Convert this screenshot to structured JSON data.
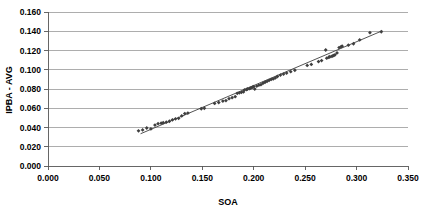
{
  "chart_data": {
    "type": "scatter",
    "title": "",
    "xlabel": "SOA",
    "ylabel": "IPBA - AVG",
    "xlim": [
      0.0,
      0.35
    ],
    "ylim": [
      0.0,
      0.16
    ],
    "grid": true,
    "grid_axis": "y",
    "legend": false,
    "legend_position": "none",
    "marker_style": "diamond",
    "marker_color": "#3f3f3f",
    "xticks": [
      0.0,
      0.05,
      0.1,
      0.15,
      0.2,
      0.25,
      0.3,
      0.35
    ],
    "xtick_labels": [
      "0.000",
      "0.050",
      "0.100",
      "0.150",
      "0.200",
      "0.250",
      "0.300",
      "0.350"
    ],
    "yticks": [
      0.0,
      0.02,
      0.04,
      0.06,
      0.08,
      0.1,
      0.12,
      0.14,
      0.16
    ],
    "ytick_labels": [
      "0.000",
      "0.020",
      "0.040",
      "0.060",
      "0.080",
      "0.100",
      "0.120",
      "0.140",
      "0.160"
    ],
    "series": [
      {
        "name": "IPBA - AVG",
        "type": "scatter",
        "points": [
          [
            0.088,
            0.0365
          ],
          [
            0.092,
            0.0375
          ],
          [
            0.096,
            0.0395
          ],
          [
            0.1,
            0.0385
          ],
          [
            0.104,
            0.0425
          ],
          [
            0.107,
            0.044
          ],
          [
            0.11,
            0.0445
          ],
          [
            0.112,
            0.045
          ],
          [
            0.115,
            0.0455
          ],
          [
            0.118,
            0.0465
          ],
          [
            0.121,
            0.048
          ],
          [
            0.124,
            0.049
          ],
          [
            0.127,
            0.0495
          ],
          [
            0.13,
            0.052
          ],
          [
            0.133,
            0.0545
          ],
          [
            0.136,
            0.055
          ],
          [
            0.149,
            0.0595
          ],
          [
            0.152,
            0.06
          ],
          [
            0.162,
            0.065
          ],
          [
            0.166,
            0.066
          ],
          [
            0.17,
            0.0675
          ],
          [
            0.173,
            0.068
          ],
          [
            0.176,
            0.07
          ],
          [
            0.179,
            0.071
          ],
          [
            0.182,
            0.072
          ],
          [
            0.184,
            0.0755
          ],
          [
            0.186,
            0.076
          ],
          [
            0.188,
            0.0765
          ],
          [
            0.19,
            0.077
          ],
          [
            0.191,
            0.079
          ],
          [
            0.193,
            0.0795
          ],
          [
            0.194,
            0.08
          ],
          [
            0.196,
            0.0805
          ],
          [
            0.197,
            0.081
          ],
          [
            0.198,
            0.0815
          ],
          [
            0.199,
            0.082
          ],
          [
            0.2,
            0.0825
          ],
          [
            0.201,
            0.08
          ],
          [
            0.203,
            0.083
          ],
          [
            0.205,
            0.084
          ],
          [
            0.207,
            0.0845
          ],
          [
            0.209,
            0.086
          ],
          [
            0.211,
            0.087
          ],
          [
            0.213,
            0.088
          ],
          [
            0.215,
            0.089
          ],
          [
            0.217,
            0.09
          ],
          [
            0.219,
            0.0905
          ],
          [
            0.221,
            0.0915
          ],
          [
            0.223,
            0.093
          ],
          [
            0.226,
            0.0945
          ],
          [
            0.229,
            0.0955
          ],
          [
            0.232,
            0.0965
          ],
          [
            0.236,
            0.098
          ],
          [
            0.24,
            0.0995
          ],
          [
            0.252,
            0.1045
          ],
          [
            0.256,
            0.1055
          ],
          [
            0.263,
            0.1085
          ],
          [
            0.266,
            0.1095
          ],
          [
            0.27,
            0.1205
          ],
          [
            0.271,
            0.112
          ],
          [
            0.273,
            0.113
          ],
          [
            0.274,
            0.1135
          ],
          [
            0.276,
            0.114
          ],
          [
            0.277,
            0.1145
          ],
          [
            0.278,
            0.115
          ],
          [
            0.279,
            0.1155
          ],
          [
            0.281,
            0.1175
          ],
          [
            0.283,
            0.123
          ],
          [
            0.285,
            0.124
          ],
          [
            0.286,
            0.1245
          ],
          [
            0.292,
            0.1255
          ],
          [
            0.297,
            0.127
          ],
          [
            0.303,
            0.131
          ],
          [
            0.313,
            0.1385
          ],
          [
            0.324,
            0.1395
          ]
        ]
      },
      {
        "name": "Linear trendline",
        "type": "line",
        "points": [
          [
            0.09,
            0.0335
          ],
          [
            0.325,
            0.1405
          ]
        ]
      }
    ]
  }
}
